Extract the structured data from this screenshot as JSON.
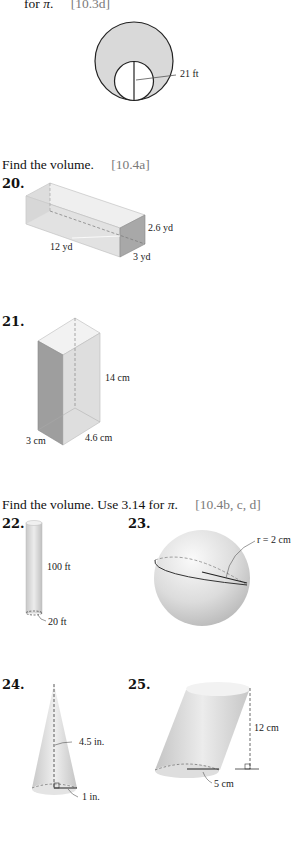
{
  "section_19": {
    "instruction_tail": "for",
    "pi_symbol": "π",
    "instruction_end": ".",
    "reference": "[10.3d]",
    "figure": {
      "type": "circle-with-inner-circle",
      "label": "21 ft"
    }
  },
  "section_volume": {
    "instruction": "Find the volume.",
    "reference": "[10.4a]"
  },
  "problem_20": {
    "number": "20.",
    "figure": "rectangular-prism",
    "labels": {
      "height": "2.6 yd",
      "length": "12 yd",
      "width": "3 yd"
    }
  },
  "problem_21": {
    "number": "21.",
    "figure": "rectangular-prism",
    "labels": {
      "height": "14 cm",
      "width": "3 cm",
      "depth": "4.6 cm"
    }
  },
  "section_volume_pi": {
    "instruction": "Find the volume. Use 3.14 for",
    "pi_symbol": "π",
    "instruction_end": ".",
    "reference": "[10.4b, c, d]"
  },
  "problem_22": {
    "number": "22.",
    "figure": "cylinder",
    "labels": {
      "height": "100 ft",
      "diameter": "20 ft"
    }
  },
  "problem_23": {
    "number": "23.",
    "figure": "sphere",
    "labels": {
      "radius": "r = 2 cm"
    }
  },
  "problem_24": {
    "number": "24.",
    "figure": "cone",
    "labels": {
      "height": "4.5 in.",
      "radius": "1 in."
    }
  },
  "problem_25": {
    "number": "25.",
    "figure": "oblique-cylinder",
    "labels": {
      "height": "12 cm",
      "radius": "5 cm"
    }
  }
}
